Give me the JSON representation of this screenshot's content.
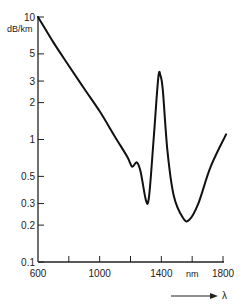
{
  "chart_data": {
    "type": "line",
    "title": "",
    "xlabel": "nm",
    "xlabel_arrow": "λ",
    "ylabel": "dB/km",
    "yscale": "log",
    "xlim": [
      600,
      1800
    ],
    "ylim": [
      0.1,
      10
    ],
    "grid": false,
    "legend": null,
    "x_ticks": [
      600,
      800,
      1000,
      1200,
      1400,
      1600,
      1800
    ],
    "x_tick_labels": [
      "600",
      "",
      "1000",
      "",
      "1400",
      "nm",
      "1800"
    ],
    "y_ticks": [
      10,
      5,
      3,
      2,
      1,
      0.5,
      0.3,
      0.2,
      0.1
    ],
    "y_tick_labels": [
      "10",
      "5",
      "3",
      "2",
      "1",
      "0.5",
      "0.3",
      "0.2",
      "0.1"
    ],
    "series": [
      {
        "name": "Attenuation",
        "x": [
          600,
          700,
          800,
          900,
          1000,
          1100,
          1180,
          1210,
          1240,
          1265,
          1300,
          1320,
          1350,
          1380,
          1395,
          1410,
          1440,
          1480,
          1540,
          1580,
          1640,
          1720,
          1820
        ],
        "y": [
          10,
          6.2,
          4.0,
          2.6,
          1.7,
          1.05,
          0.72,
          0.6,
          0.65,
          0.55,
          0.32,
          0.34,
          1.0,
          3.2,
          3.3,
          2.5,
          0.8,
          0.35,
          0.23,
          0.22,
          0.3,
          0.6,
          1.1
        ]
      }
    ]
  },
  "axes": {
    "y_unit": "dB/km",
    "x_unit": "nm",
    "lambda_symbol": "λ"
  }
}
